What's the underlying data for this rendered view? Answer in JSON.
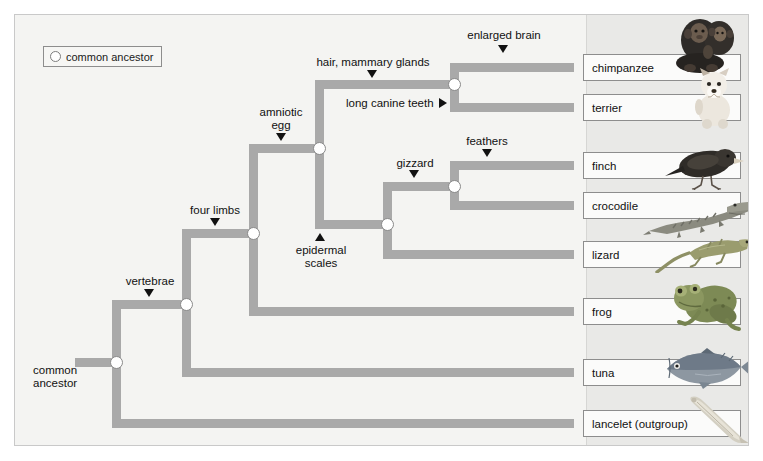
{
  "diagram": {
    "legend": {
      "icon": "open-circle-icon",
      "label": "common ancestor"
    },
    "root_label_line1": "common",
    "root_label_line2": "ancestor",
    "branch_color": "#a9a9a9",
    "node_fill": "#ffffff",
    "node_stroke": "#8a8a8a",
    "panel_background": "#f4f4f2",
    "band_background": "#e9e9e7",
    "traits": [
      {
        "id": "vertebrae",
        "text": "vertebrae",
        "arrow": "down"
      },
      {
        "id": "four-limbs",
        "text": "four limbs",
        "arrow": "down"
      },
      {
        "id": "amniotic-egg",
        "line1": "amniotic",
        "line2": "egg",
        "text": "amniotic egg",
        "arrow": "down"
      },
      {
        "id": "hair-mammary",
        "text": "hair, mammary glands",
        "arrow": "down"
      },
      {
        "id": "enlarged-brain",
        "text": "enlarged brain",
        "arrow": "down"
      },
      {
        "id": "long-canine-teeth",
        "text": "long canine teeth",
        "arrow": "right"
      },
      {
        "id": "epidermal-scales",
        "line1": "epidermal",
        "line2": "scales",
        "text": "epidermal scales",
        "arrow": "up"
      },
      {
        "id": "gizzard",
        "text": "gizzard",
        "arrow": "down"
      },
      {
        "id": "feathers",
        "text": "feathers",
        "arrow": "down"
      }
    ],
    "taxa": [
      {
        "id": "chimpanzee",
        "label": "chimpanzee",
        "art": "chimpanzee-image"
      },
      {
        "id": "terrier",
        "label": "terrier",
        "art": "terrier-dog-image"
      },
      {
        "id": "finch",
        "label": "finch",
        "art": "finch-bird-image"
      },
      {
        "id": "crocodile",
        "label": "crocodile",
        "art": "crocodile-image"
      },
      {
        "id": "lizard",
        "label": "lizard",
        "art": "lizard-image"
      },
      {
        "id": "frog",
        "label": "frog",
        "art": "frog-image"
      },
      {
        "id": "tuna",
        "label": "tuna",
        "art": "tuna-fish-image"
      },
      {
        "id": "lancelet",
        "label": "lancelet (outgroup)",
        "art": "lancelet-image"
      }
    ],
    "nodes": [
      {
        "id": "root-node",
        "trait_below": "vertebrae"
      },
      {
        "id": "vertebrate-node",
        "trait_below": "four limbs"
      },
      {
        "id": "tetrapod-node",
        "trait_below": "amniotic egg"
      },
      {
        "id": "amniote-node",
        "trait_below": "hair, mammary glands"
      },
      {
        "id": "mammal-node",
        "trait_below": "enlarged brain"
      },
      {
        "id": "reptile-node",
        "trait_below": "gizzard"
      },
      {
        "id": "archosaur-node",
        "trait_below": "feathers"
      }
    ]
  }
}
